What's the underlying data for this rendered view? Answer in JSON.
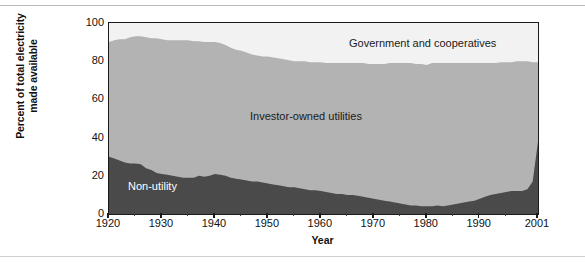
{
  "chart_data": {
    "type": "area",
    "stacked": true,
    "title": "",
    "xlabel": "Year",
    "ylabel": "Percent of total electricity made available",
    "ylabel_line1": "Percent of total electricity",
    "ylabel_line2": "made available",
    "xlim": [
      1920,
      2001
    ],
    "ylim": [
      0,
      100
    ],
    "grid": false,
    "legend_position": "inline-annotations",
    "y_ticks": [
      0,
      20,
      40,
      60,
      80,
      100
    ],
    "x_ticks": [
      1920,
      1930,
      1940,
      1950,
      1960,
      1970,
      1980,
      1990,
      2001
    ],
    "x_tick_labels": [
      "1920",
      "1930",
      "1940",
      "1950",
      "1960",
      "1970",
      "1980",
      "1990",
      "2001"
    ],
    "x": [
      1920,
      1921,
      1922,
      1923,
      1924,
      1925,
      1926,
      1927,
      1928,
      1929,
      1930,
      1931,
      1932,
      1933,
      1934,
      1935,
      1936,
      1937,
      1938,
      1939,
      1940,
      1941,
      1942,
      1943,
      1944,
      1945,
      1946,
      1947,
      1948,
      1949,
      1950,
      1951,
      1952,
      1953,
      1954,
      1955,
      1956,
      1957,
      1958,
      1959,
      1960,
      1961,
      1962,
      1963,
      1964,
      1965,
      1966,
      1967,
      1968,
      1969,
      1970,
      1971,
      1972,
      1973,
      1974,
      1975,
      1976,
      1977,
      1978,
      1979,
      1980,
      1981,
      1982,
      1983,
      1984,
      1985,
      1986,
      1987,
      1988,
      1989,
      1990,
      1991,
      1992,
      1993,
      1994,
      1995,
      1996,
      1997,
      1998,
      1999,
      2000,
      2001
    ],
    "series": [
      {
        "name": "Non-utility",
        "color": "#4a4a4a",
        "values": [
          30,
          29,
          28,
          27,
          26.5,
          26.5,
          26,
          24,
          23,
          21.5,
          21,
          20.5,
          20,
          19.5,
          19,
          19,
          19,
          20,
          19.5,
          20,
          21,
          20.5,
          20,
          19,
          18.5,
          18,
          17.5,
          17,
          17,
          16.5,
          16,
          15.5,
          15,
          14.5,
          14,
          14,
          13.5,
          13,
          12.5,
          12.5,
          12,
          11.5,
          11,
          10.5,
          10.5,
          10,
          10,
          9.5,
          9,
          8.5,
          8,
          7.5,
          7,
          6.5,
          6,
          5.5,
          5,
          4.5,
          4.5,
          4,
          4,
          4,
          4.5,
          4,
          4.5,
          5,
          5.5,
          6,
          6.5,
          7,
          8,
          9,
          10,
          10.5,
          11,
          11.5,
          12,
          12,
          12,
          13,
          17,
          38
        ]
      },
      {
        "name": "Investor-owned utilities",
        "color": "#b3b3b3",
        "values": [
          60,
          62,
          63.5,
          64.5,
          66,
          66.5,
          67,
          68.5,
          69,
          70.5,
          70.5,
          70.5,
          71,
          71.5,
          72,
          72,
          71.5,
          70.5,
          70.5,
          70,
          69,
          69,
          68.5,
          68,
          67.5,
          67.5,
          67,
          66.5,
          66,
          66,
          66.5,
          66.5,
          66.5,
          66.5,
          66.5,
          66,
          66.5,
          67,
          67,
          67,
          67.5,
          67.5,
          68,
          68.5,
          68.5,
          69,
          69,
          69.5,
          70,
          70,
          70.5,
          71,
          71.5,
          72.5,
          73,
          73.5,
          74,
          74.5,
          74,
          74.5,
          74,
          75,
          74.5,
          75,
          74.5,
          74,
          73.5,
          73,
          72.5,
          72,
          71,
          70,
          69,
          68.5,
          68.5,
          68,
          67.5,
          68,
          68,
          67,
          62.5,
          41.5
        ]
      },
      {
        "name": "Government and cooperatives",
        "color": "#f2f2f2",
        "values": [
          10,
          9,
          8.5,
          8.5,
          7.5,
          7,
          7,
          7.5,
          8,
          8,
          8.5,
          9,
          9,
          9,
          9,
          9,
          9.5,
          9.5,
          10,
          10,
          10,
          10.5,
          11.5,
          13,
          14,
          14.5,
          15.5,
          16.5,
          17,
          17.5,
          17.5,
          18,
          18.5,
          19,
          19.5,
          20,
          20,
          20,
          20.5,
          20.5,
          20.5,
          21,
          21,
          21,
          21,
          21,
          21,
          21,
          21,
          21.5,
          21.5,
          21.5,
          21.5,
          21,
          21,
          21,
          21,
          21,
          21.5,
          21.5,
          22,
          21,
          21,
          20.5,
          20.5,
          21,
          20.5,
          21,
          21,
          21,
          21,
          21,
          21,
          21,
          20.5,
          20.5,
          20.5,
          20,
          20,
          20,
          20.5,
          20.5
        ]
      }
    ],
    "annotations": [
      {
        "text": "Government and cooperatives",
        "x": 1981,
        "y": 91
      },
      {
        "text": "Investor-owned utilities",
        "x": 1957,
        "y": 50
      },
      {
        "text": "Non-utility",
        "x": 1929,
        "y": 14
      }
    ]
  },
  "colors": {
    "non_utility": "#4a4a4a",
    "investor_owned": "#b3b3b3",
    "government": "#f2f2f2",
    "axis": "#1a1a1a",
    "text": "#111111",
    "page_background": "#ffffff",
    "rule": "#b9b9b9"
  }
}
